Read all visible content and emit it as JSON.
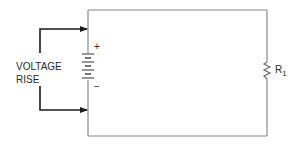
{
  "diagram": {
    "type": "circuit-schematic",
    "annotation": {
      "line1": "VOLTAGE",
      "line2": "RISE"
    },
    "battery": {
      "positive_label": "+",
      "negative_label": "−"
    },
    "resistor": {
      "label": "R",
      "subscript": "1"
    },
    "colors": {
      "wire": "#8a8a8a",
      "arrow": "#1a1a1a",
      "text": "#2a2a2a"
    }
  }
}
